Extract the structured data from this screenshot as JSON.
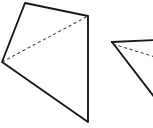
{
  "figure": {
    "background_color": "#ffffff",
    "width": 153,
    "height": 128,
    "stroke_color": "#1a1a1a",
    "dashed_stroke_color": "#4d4d4d",
    "shapes": [
      {
        "name": "left-quadrilateral",
        "kind": "quadrilateral",
        "fill": "#ffffff",
        "outline_points": "25,3 88,16 88,122 2,62",
        "vertices": [
          {
            "label": "top",
            "x": 25,
            "y": 3
          },
          {
            "label": "right-upper",
            "x": 88,
            "y": 16
          },
          {
            "label": "bottom-right",
            "x": 88,
            "y": 122
          },
          {
            "label": "left",
            "x": 2,
            "y": 62
          }
        ],
        "diagonal": {
          "name": "dashed-diagonal",
          "style": "dashed",
          "from": {
            "x": 2,
            "y": 62
          },
          "to": {
            "x": 88,
            "y": 16
          }
        }
      },
      {
        "name": "right-quadrilateral-cropped",
        "kind": "quadrilateral-cropped",
        "fill": "#ffffff",
        "outline_points": "112,42 153,40 153,95 112,42",
        "vertices": [
          {
            "label": "apex",
            "x": 112,
            "y": 42
          },
          {
            "label": "top-right-offscreen",
            "x": 153,
            "y": 40
          },
          {
            "label": "bottom-right-offscreen",
            "x": 153,
            "y": 95
          }
        ],
        "diagonal": {
          "name": "dashed-diagonal",
          "style": "dashed",
          "from": {
            "x": 113,
            "y": 44
          },
          "to": {
            "x": 153,
            "y": 56
          }
        }
      }
    ]
  }
}
